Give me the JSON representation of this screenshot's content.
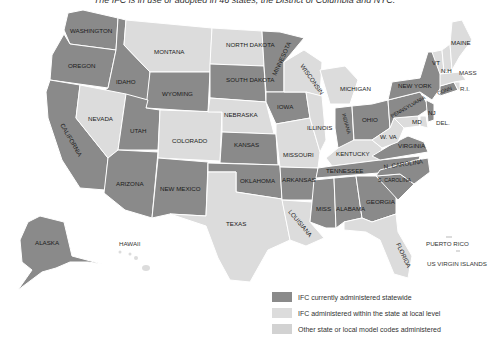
{
  "title": "The IFC is in use or adopted in 46 states, the District of Columbia and NYC.",
  "colors": {
    "statewide": "#8a8a8a",
    "local": "#dcdcdc",
    "other": "#d2d2d2",
    "border": "#ffffff"
  },
  "states": {
    "washington": {
      "label": "WASHINGTON",
      "category": "statewide"
    },
    "oregon": {
      "label": "OREGON",
      "category": "statewide"
    },
    "california": {
      "label": "CALIFORNIA",
      "category": "statewide"
    },
    "idaho": {
      "label": "IDAHO",
      "category": "statewide"
    },
    "nevada": {
      "label": "NEVADA",
      "category": "local"
    },
    "montana": {
      "label": "MONTANA",
      "category": "local"
    },
    "wyoming": {
      "label": "WYOMING",
      "category": "statewide"
    },
    "utah": {
      "label": "UTAH",
      "category": "statewide"
    },
    "arizona": {
      "label": "ARIZONA",
      "category": "statewide"
    },
    "colorado": {
      "label": "COLORADO",
      "category": "local"
    },
    "new_mexico": {
      "label": "NEW MEXICO",
      "category": "statewide"
    },
    "north_dakota": {
      "label": "NORTH DAKOTA",
      "category": "local"
    },
    "south_dakota": {
      "label": "SOUTH DAKOTA",
      "category": "statewide"
    },
    "nebraska": {
      "label": "NEBRASKA",
      "category": "local"
    },
    "kansas": {
      "label": "KANSAS",
      "category": "statewide"
    },
    "oklahoma": {
      "label": "OKLAHOMA",
      "category": "statewide"
    },
    "texas": {
      "label": "TEXAS",
      "category": "local"
    },
    "minnesota": {
      "label": "MINNESOTA",
      "category": "statewide"
    },
    "iowa": {
      "label": "IOWA",
      "category": "statewide"
    },
    "missouri": {
      "label": "MISSOURI",
      "category": "local"
    },
    "arkansas": {
      "label": "ARKANSAS",
      "category": "statewide"
    },
    "louisiana": {
      "label": "LOUISIANA",
      "category": "local"
    },
    "wisconsin": {
      "label": "WISCONSIN",
      "category": "local"
    },
    "illinois": {
      "label": "ILLINOIS",
      "category": "local"
    },
    "michigan": {
      "label": "MICHIGAN",
      "category": "local"
    },
    "indiana": {
      "label": "INDIANA",
      "category": "statewide"
    },
    "ohio": {
      "label": "OHIO",
      "category": "statewide"
    },
    "kentucky": {
      "label": "KENTUCKY",
      "category": "local"
    },
    "tennessee": {
      "label": "TENNESSEE",
      "category": "statewide"
    },
    "mississippi": {
      "label": "MISS",
      "category": "statewide"
    },
    "alabama": {
      "label": "ALABAMA",
      "category": "statewide"
    },
    "georgia": {
      "label": "GEORGIA",
      "category": "statewide"
    },
    "florida": {
      "label": "FLORIDA",
      "category": "local"
    },
    "south_carolina": {
      "label": "S. CAROLINA",
      "category": "statewide"
    },
    "north_carolina": {
      "label": "N. CAROLINA",
      "category": "statewide"
    },
    "virginia": {
      "label": "VIRGINIA",
      "category": "statewide"
    },
    "west_virginia": {
      "label": "W. VA",
      "category": "local"
    },
    "maryland": {
      "label": "MD",
      "category": "local"
    },
    "delaware": {
      "label": "DEL.",
      "category": "local"
    },
    "pennsylvania": {
      "label": "PENNSYLVANIA",
      "category": "statewide"
    },
    "new_jersey": {
      "label": "NJ",
      "category": "statewide"
    },
    "new_york": {
      "label": "NEW YORK",
      "category": "statewide"
    },
    "connecticut": {
      "label": "CONN",
      "category": "statewide"
    },
    "rhode_island": {
      "label": "R.I.",
      "category": "local"
    },
    "massachusetts": {
      "label": "MASS",
      "category": "local"
    },
    "vermont": {
      "label": "VT",
      "category": "local"
    },
    "new_hampshire": {
      "label": "N.H",
      "category": "local"
    },
    "maine": {
      "label": "MAINE",
      "category": "local"
    },
    "alaska": {
      "label": "ALASKA",
      "category": "statewide"
    },
    "hawaii": {
      "label": "HAWAII",
      "category": "local"
    }
  },
  "territories": {
    "puerto_rico": "PUERTO RICO",
    "us_virgin_islands": "US VIRGIN ISLANDS"
  },
  "legend": [
    {
      "label": "IFC currently administered statewide",
      "color": "#8a8a8a"
    },
    {
      "label": "IFC administered within the state at local level",
      "color": "#dcdcdc"
    },
    {
      "label": "Other state or local model codes administered",
      "color": "#d2d2d2"
    }
  ]
}
